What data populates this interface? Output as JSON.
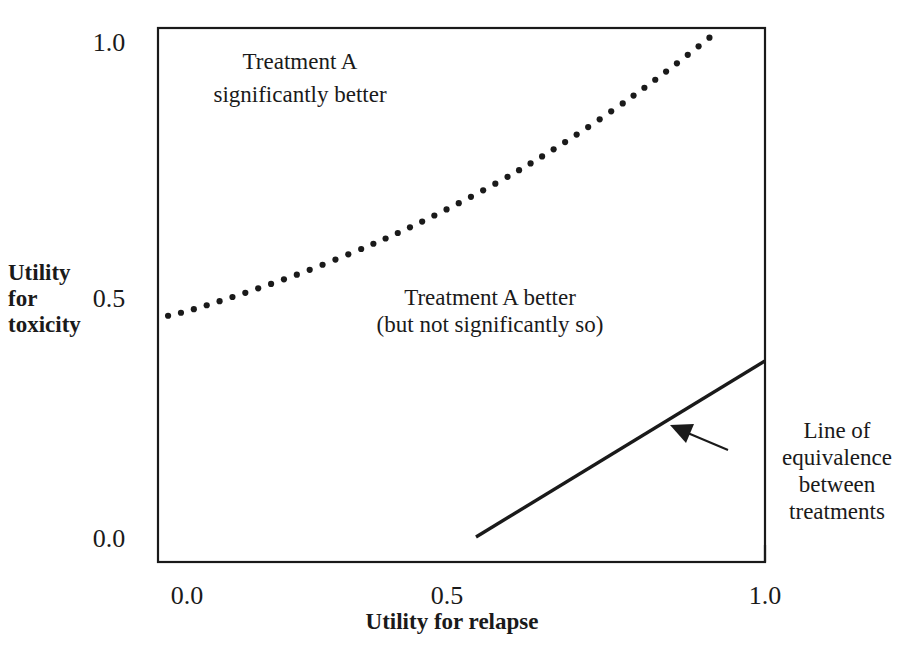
{
  "figure": {
    "background_color": "#ffffff",
    "ink_color": "#1a1a1a"
  },
  "axes": {
    "x_title": "Utility for relapse",
    "y_title_lines": [
      "Utility",
      "for",
      "toxicity"
    ],
    "x_ticks": [
      "0.0",
      "0.5",
      "1.0"
    ],
    "y_ticks": [
      "1.0",
      "0.5",
      "0.0"
    ]
  },
  "annotations": {
    "region_upper_left": [
      "Treatment A",
      "significantly better"
    ],
    "region_middle": [
      "Treatment A better",
      "(but not significantly so)"
    ],
    "line_callout": [
      "Line of",
      "equivalence",
      "between",
      "treatments"
    ]
  },
  "chart_data": {
    "type": "line",
    "title": "",
    "xlabel": "Utility for relapse",
    "ylabel": "Utility for toxicity",
    "xlim": [
      -0.055,
      1.0
    ],
    "ylim": [
      -0.05,
      1.05
    ],
    "xticks": [
      0.0,
      0.5,
      1.0
    ],
    "yticks": [
      0.0,
      0.5,
      1.0
    ],
    "xticklabels": [
      "0.0",
      "0.5",
      "1.0"
    ],
    "yticklabels": [
      "0.0",
      "0.5",
      "1.0"
    ],
    "grid": false,
    "legend": "none",
    "frame": "full-box",
    "series": [
      {
        "name": "Significance boundary",
        "style": "dotted",
        "marker": "dot",
        "color": "#1a1a1a",
        "x": [
          -0.055,
          0.0,
          0.05,
          0.1,
          0.15,
          0.2,
          0.25,
          0.3,
          0.35,
          0.4,
          0.45,
          0.5,
          0.55,
          0.6,
          0.65,
          0.7,
          0.75,
          0.8,
          0.85,
          0.9,
          0.95,
          1.0
        ],
        "y": [
          0.44,
          0.455,
          0.473,
          0.492,
          0.512,
          0.533,
          0.556,
          0.58,
          0.605,
          0.632,
          0.661,
          0.691,
          0.723,
          0.757,
          0.793,
          0.831,
          0.871,
          0.913,
          0.957,
          1.003,
          1.051,
          1.05
        ]
      },
      {
        "name": "Line of equivalence",
        "style": "solid",
        "color": "#1a1a1a",
        "x": [
          0.5,
          1.0
        ],
        "y": [
          0.0,
          0.355
        ]
      }
    ],
    "annotations": [
      {
        "text": "Treatment A significantly better",
        "x": 0.24,
        "y": 0.955,
        "region": "above-dotted-curve"
      },
      {
        "text": "Treatment A better (but not significantly so)",
        "x": 0.56,
        "y": 0.53,
        "region": "between-curves"
      },
      {
        "text": "Line of equivalence between treatments",
        "x": 1.13,
        "y": 0.22,
        "region": "outside-right"
      }
    ],
    "arrow": {
      "from_x": 0.955,
      "from_y": 0.215,
      "to_x": 0.87,
      "to_y": 0.255
    }
  }
}
